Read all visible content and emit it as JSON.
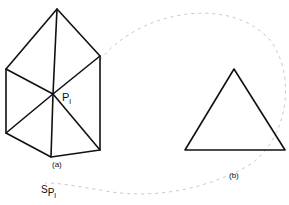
{
  "figure_a": {
    "label": "(a)",
    "point_label_main": "P",
    "point_label_sub": "l",
    "vertices": {
      "apex": [
        57,
        9
      ],
      "upper_left": [
        6,
        69
      ],
      "upper_right": [
        100,
        56
      ],
      "center": [
        53,
        94
      ],
      "lower_left": [
        6,
        133
      ],
      "bottom": [
        51,
        157
      ],
      "lower_right": [
        100,
        150
      ]
    }
  },
  "figure_b": {
    "label": "(b)",
    "vertices": {
      "apex": [
        234,
        69
      ],
      "left": [
        185,
        150
      ],
      "right": [
        285,
        150
      ]
    }
  },
  "star_label": {
    "main": "S",
    "sub_main": "P",
    "sub_sub": "l"
  },
  "colors": {
    "stroke": "#111111",
    "curve": "#c8c8c8",
    "background": "#ffffff"
  }
}
